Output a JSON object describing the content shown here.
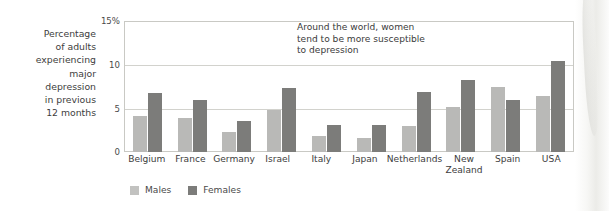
{
  "chart_data": {
    "type": "bar",
    "title": "",
    "xlabel": "",
    "ylabel": "Percentage of adults experiencing major depression in previous 12 months",
    "ylim": [
      0,
      15
    ],
    "yticks": [
      "0",
      "5",
      "10",
      "15%"
    ],
    "grid": true,
    "legend_position": "bottom-left",
    "categories": [
      "Belgium",
      "France",
      "Germany",
      "Israel",
      "Italy",
      "Japan",
      "New Zealand",
      "Netherlands",
      "Spain",
      "USA"
    ],
    "categories_display": [
      "Belgium",
      "France",
      "Germany",
      "Israel",
      "Italy",
      "Japan",
      "Netherlands",
      "New\nZealand",
      "Spain",
      "USA"
    ],
    "series": [
      {
        "name": "Males",
        "color": "#b9b9b7",
        "values": [
          4.1,
          3.9,
          2.3,
          4.8,
          1.8,
          1.6,
          3.0,
          5.2,
          7.5,
          6.5
        ]
      },
      {
        "name": "Females",
        "color": "#7c7c7a",
        "values": [
          6.8,
          6.0,
          3.6,
          7.4,
          3.1,
          3.1,
          6.9,
          8.3,
          6.0,
          10.5
        ]
      }
    ],
    "annotations": [
      "Around the world, women\ntend to be more susceptible\nto depression"
    ]
  },
  "axis": {
    "caption_lines": [
      "Percentage",
      "of adults",
      "experiencing",
      "major",
      "depression",
      "in previous",
      "12 months"
    ],
    "yticks": [
      {
        "label": "15%",
        "value": 15
      },
      {
        "label": "10",
        "value": 10
      },
      {
        "label": "5",
        "value": 5
      },
      {
        "label": "0",
        "value": 0
      }
    ]
  },
  "annotation": {
    "line1": "Around the world, women",
    "line2": "tend to be more susceptible",
    "line3": "to depression"
  },
  "xlabels": [
    {
      "line1": "Belgium",
      "line2": ""
    },
    {
      "line1": "France",
      "line2": ""
    },
    {
      "line1": "Germany",
      "line2": ""
    },
    {
      "line1": "Israel",
      "line2": ""
    },
    {
      "line1": "Italy",
      "line2": ""
    },
    {
      "line1": "Japan",
      "line2": ""
    },
    {
      "line1": "Netherlands",
      "line2": ""
    },
    {
      "line1": "New",
      "line2": "Zealand"
    },
    {
      "line1": "Spain",
      "line2": ""
    },
    {
      "line1": "USA",
      "line2": ""
    }
  ],
  "legend": {
    "items": [
      {
        "label": "Males",
        "color": "#c2c2c0"
      },
      {
        "label": "Females",
        "color": "#7c7c7a"
      }
    ]
  }
}
